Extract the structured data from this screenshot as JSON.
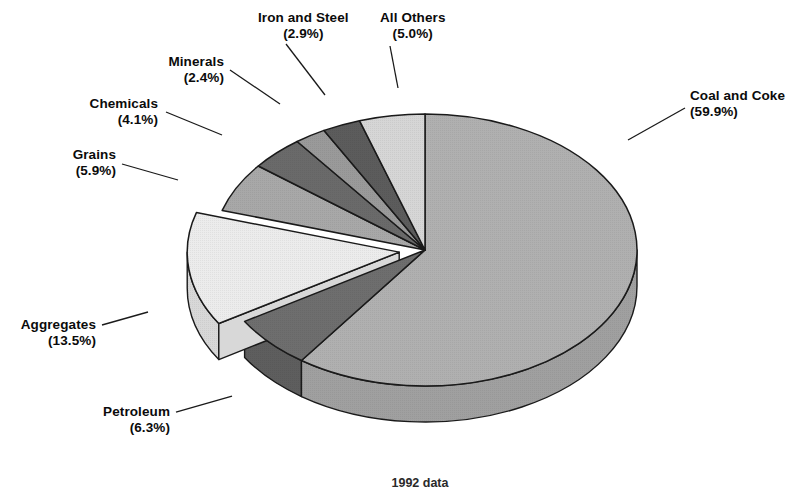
{
  "caption": {
    "text": "1992 data"
  },
  "chart_data": {
    "type": "pie",
    "title": "",
    "subtitle": "",
    "xlabel": "",
    "ylabel": "",
    "legend_position": "none",
    "grid": false,
    "style": "3d-exploded-grayscale",
    "value_unit": "percent",
    "start_angle_deg": 0,
    "direction": "clockwise",
    "categories": [
      "Coal and Coke",
      "Petroleum",
      "Aggregates",
      "Grains",
      "Chemicals",
      "Minerals",
      "Iron and Steel",
      "All Others"
    ],
    "values": [
      59.9,
      6.3,
      13.5,
      5.9,
      4.1,
      2.4,
      2.9,
      5.0
    ],
    "slices": [
      {
        "label": "Coal and Coke",
        "percent_text": "(59.9%)",
        "value": 59.9,
        "color": "#b0b0b0",
        "side_color": "#a0a0a0",
        "exploded": false,
        "label_align": "left",
        "label_x": 690,
        "label_y": 88,
        "leader": [
          [
            685,
            108
          ],
          [
            628,
            140
          ]
        ]
      },
      {
        "label": "Petroleum",
        "percent_text": "(6.3%)",
        "value": 6.3,
        "color": "#6e6e6e",
        "side_color": "#5e5e5e",
        "exploded": false,
        "label_align": "right",
        "label_x": 170,
        "label_y": 404,
        "leader": [
          [
            176,
            412
          ],
          [
            232,
            396
          ]
        ]
      },
      {
        "label": "Aggregates",
        "percent_text": "(13.5%)",
        "value": 13.5,
        "color": "#ececec",
        "side_color": "#d8d8d8",
        "exploded": true,
        "label_align": "right",
        "label_x": 96,
        "label_y": 317,
        "leader": [
          [
            102,
            325
          ],
          [
            148,
            312
          ]
        ]
      },
      {
        "label": "Grains",
        "percent_text": "(5.9%)",
        "value": 5.9,
        "color": "#a8a8a8",
        "side_color": "#989898",
        "exploded": false,
        "label_align": "right",
        "label_x": 116,
        "label_y": 147,
        "leader": [
          [
            122,
            164
          ],
          [
            178,
            180
          ]
        ]
      },
      {
        "label": "Chemicals",
        "percent_text": "(4.1%)",
        "value": 4.1,
        "color": "#6a6a6a",
        "side_color": "#5a5a5a",
        "exploded": false,
        "label_align": "right",
        "label_x": 158,
        "label_y": 96,
        "leader": [
          [
            166,
            112
          ],
          [
            222,
            135
          ]
        ]
      },
      {
        "label": "Minerals",
        "percent_text": "(2.4%)",
        "value": 2.4,
        "color": "#9a9a9a",
        "side_color": "#8a8a8a",
        "exploded": false,
        "label_align": "right",
        "label_x": 224,
        "label_y": 54,
        "leader": [
          [
            230,
            70
          ],
          [
            280,
            104
          ]
        ]
      },
      {
        "label": "Iron and Steel",
        "percent_text": "(2.9%)",
        "value": 2.9,
        "color": "#5c5c5c",
        "side_color": "#4c4c4c",
        "exploded": false,
        "label_align": "center",
        "label_x": 258,
        "label_y": 10,
        "leader": [
          [
            286,
            44
          ],
          [
            325,
            95
          ]
        ]
      },
      {
        "label": "All Others",
        "percent_text": "(5.0%)",
        "value": 5.0,
        "color": "#d6d6d6",
        "side_color": "#c4c4c4",
        "exploded": false,
        "label_align": "center",
        "label_x": 380,
        "label_y": 10,
        "leader": [
          [
            390,
            46
          ],
          [
            398,
            88
          ]
        ]
      }
    ],
    "geometry": {
      "cx": 425,
      "cy": 250,
      "rx": 212,
      "ry": 136,
      "depth": 36,
      "explode_offset": 26
    },
    "colors": {
      "outline": "#1a1a1a",
      "background": "#ffffff",
      "text": "#0b0b0b"
    }
  }
}
